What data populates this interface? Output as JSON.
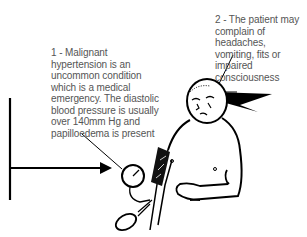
{
  "diagram": {
    "labels": [
      {
        "id": "1",
        "text": "1 - Malignant hypertension is an uncommon condition which is a medical emergency. The diastolic blood pressure is usually over 140mm Hg and papilloedema is present"
      },
      {
        "id": "2",
        "text": "2 - The patient may complain of headaches, vomiting, fits or impaired consciousness"
      }
    ],
    "illustration": {
      "subject": "patient",
      "elements": [
        "patient-figure",
        "blood-pressure-cuff",
        "sphygmomanometer-gauge",
        "inflation-bulb",
        "lightning-bolt",
        "arrow",
        "vertical-bar"
      ]
    },
    "colors": {
      "ink": "#000000",
      "text": "#555555",
      "background": "#ffffff"
    }
  }
}
